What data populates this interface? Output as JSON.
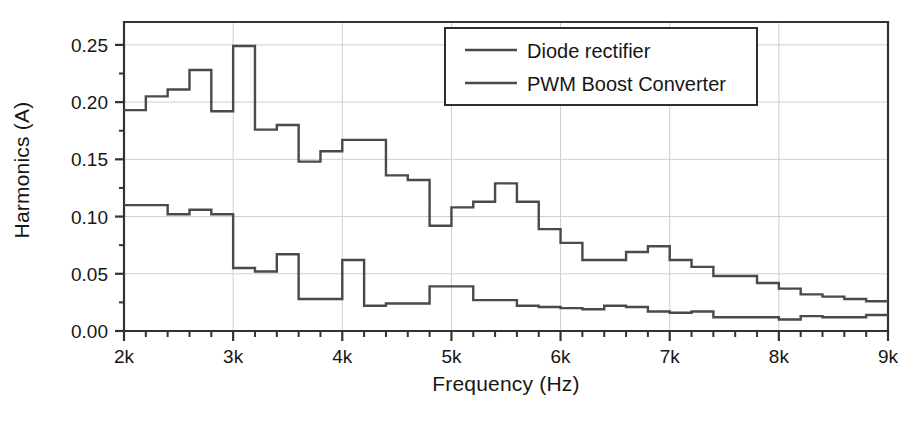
{
  "chart_data": {
    "type": "line",
    "subtype": "step",
    "title": "",
    "xlabel": "Frequency (Hz)",
    "ylabel": "Harmonics (A)",
    "xlim": [
      2000,
      9000
    ],
    "ylim": [
      0.0,
      0.27
    ],
    "yticks": [
      0.0,
      0.05,
      0.1,
      0.15,
      0.2,
      0.25
    ],
    "ytick_labels": [
      "0.00",
      "0.05",
      "0.10",
      "0.15",
      "0.20",
      "0.25"
    ],
    "xticks": [
      2000,
      3000,
      4000,
      5000,
      6000,
      7000,
      8000,
      9000
    ],
    "xtick_labels": [
      "2k",
      "3k",
      "4k",
      "5k",
      "6k",
      "7k",
      "8k",
      "9k"
    ],
    "x_minor_tick_step": 200,
    "y_minor_tick_step": 0.025,
    "grid": true,
    "grid_color": "#cfcfcf",
    "axis_color": "#333333",
    "line_color": "#4a4a4a",
    "legend_position": "top-right",
    "bin_width": 200,
    "series": [
      {
        "name": "Diode rectifier",
        "color": "#4a4a4a",
        "x": [
          2000,
          2200,
          2400,
          2600,
          2800,
          3000,
          3200,
          3400,
          3600,
          3800,
          4000,
          4200,
          4400,
          4600,
          4800,
          5000,
          5200,
          5400,
          5600,
          5800,
          6000,
          6200,
          6400,
          6600,
          6800,
          7000,
          7200,
          7400,
          7600,
          7800,
          8000,
          8200,
          8400,
          8600,
          8800
        ],
        "values": [
          0.193,
          0.205,
          0.211,
          0.228,
          0.192,
          0.249,
          0.176,
          0.18,
          0.148,
          0.157,
          0.167,
          0.167,
          0.136,
          0.132,
          0.092,
          0.108,
          0.113,
          0.129,
          0.113,
          0.089,
          0.077,
          0.062,
          0.062,
          0.069,
          0.074,
          0.062,
          0.056,
          0.048,
          0.048,
          0.042,
          0.037,
          0.032,
          0.03,
          0.028,
          0.026
        ]
      },
      {
        "name": "PWM Boost Converter",
        "color": "#4a4a4a",
        "x": [
          2000,
          2200,
          2400,
          2600,
          2800,
          3000,
          3200,
          3400,
          3600,
          3800,
          4000,
          4200,
          4400,
          4600,
          4800,
          5000,
          5200,
          5400,
          5600,
          5800,
          6000,
          6200,
          6400,
          6600,
          6800,
          7000,
          7200,
          7400,
          7600,
          7800,
          8000,
          8200,
          8400,
          8600,
          8800
        ],
        "values": [
          0.11,
          0.11,
          0.102,
          0.106,
          0.102,
          0.055,
          0.052,
          0.067,
          0.028,
          0.028,
          0.062,
          0.022,
          0.024,
          0.024,
          0.039,
          0.039,
          0.027,
          0.027,
          0.022,
          0.021,
          0.02,
          0.019,
          0.022,
          0.021,
          0.017,
          0.016,
          0.017,
          0.012,
          0.012,
          0.012,
          0.01,
          0.013,
          0.012,
          0.012,
          0.014
        ]
      }
    ]
  },
  "legend": {
    "entries": [
      {
        "label": "Diode rectifier"
      },
      {
        "label": "PWM Boost Converter"
      }
    ]
  }
}
